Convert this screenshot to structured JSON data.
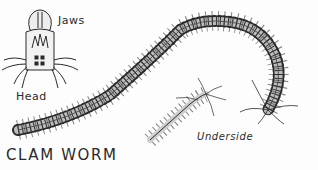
{
  "illustration": {
    "title": "CLAM WORM",
    "labels": {
      "jaws": "Jaws",
      "head": "Head",
      "underside": "Underside"
    },
    "colors": {
      "ink": "#2a2a2a",
      "paper": "#fdfdfd",
      "shade": "#9a9a9a"
    }
  }
}
